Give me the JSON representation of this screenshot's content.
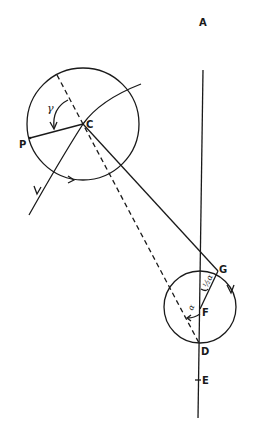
{
  "diagram": {
    "type": "geometric-construction",
    "labels": {
      "A": "A",
      "C": "C",
      "P": "P",
      "G": "G",
      "F": "F",
      "D": "D",
      "E": "E"
    },
    "angles": {
      "gamma": "γ",
      "half_alpha": "½α",
      "alpha": "α"
    },
    "elements": [
      "large-circle-centered-C",
      "small-circle-centered-F",
      "vertical-axis-A-to-E",
      "dashed-line-through-C-to-D",
      "solid-line-C-to-G",
      "radius-C-to-P",
      "orbit-curve-through-C",
      "chord-F-to-G"
    ]
  }
}
